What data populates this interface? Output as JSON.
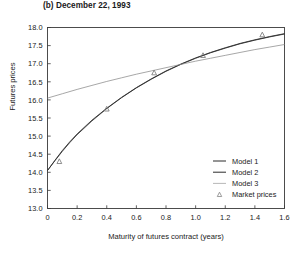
{
  "figure": {
    "panel_label": "(b) December 22, 1993",
    "xlabel": "Maturity of futures contract (years)",
    "ylabel": "Futures prices"
  },
  "chart_data": {
    "type": "line",
    "title": "(b) December 22, 1993",
    "xlabel": "Maturity of futures contract (years)",
    "ylabel": "Futures prices",
    "xlim": [
      0,
      1.6
    ],
    "ylim": [
      13.0,
      18.0
    ],
    "xticks": [
      0,
      0.2,
      0.4,
      0.6,
      0.8,
      1.0,
      1.2,
      1.4,
      1.6
    ],
    "xticklabels": [
      "0",
      "0.2",
      "0.4",
      "0.6",
      "0.8",
      "1.0",
      "1.2",
      "1.4",
      "1.6"
    ],
    "yticks": [
      13.0,
      13.5,
      14.0,
      14.5,
      15.0,
      15.5,
      16.0,
      16.5,
      17.0,
      17.5,
      18.0
    ],
    "yticklabels": [
      "13.0",
      "13.5",
      "14.0",
      "14.5",
      "15.0",
      "15.5",
      "16.0",
      "16.5",
      "17.0",
      "17.5",
      "18.0"
    ],
    "grid": false,
    "legend_position": "lower right",
    "series": [
      {
        "name": "Model 1",
        "style": "solid",
        "color": "#2b2b2b",
        "x": [
          0.0,
          0.05,
          0.1,
          0.15,
          0.2,
          0.3,
          0.4,
          0.5,
          0.6,
          0.7,
          0.8,
          0.9,
          1.0,
          1.1,
          1.2,
          1.3,
          1.4,
          1.5,
          1.6
        ],
        "y": [
          14.05,
          14.32,
          14.58,
          14.82,
          15.04,
          15.42,
          15.76,
          16.06,
          16.33,
          16.57,
          16.79,
          16.98,
          17.15,
          17.3,
          17.43,
          17.55,
          17.65,
          17.74,
          17.82
        ]
      },
      {
        "name": "Model 2",
        "style": "solid",
        "color": "#2b2b2b",
        "x": [
          0.0,
          0.05,
          0.1,
          0.15,
          0.2,
          0.3,
          0.4,
          0.5,
          0.6,
          0.7,
          0.8,
          0.9,
          1.0,
          1.1,
          1.2,
          1.3,
          1.4,
          1.5,
          1.6
        ],
        "y": [
          14.05,
          14.33,
          14.6,
          14.84,
          15.06,
          15.44,
          15.77,
          16.07,
          16.34,
          16.58,
          16.8,
          16.99,
          17.16,
          17.31,
          17.44,
          17.56,
          17.66,
          17.75,
          17.83
        ]
      },
      {
        "name": "Model 3",
        "style": "solid",
        "color": "#8a8a8a",
        "x": [
          0.0,
          0.1,
          0.2,
          0.3,
          0.4,
          0.5,
          0.6,
          0.7,
          0.8,
          0.9,
          1.0,
          1.1,
          1.2,
          1.3,
          1.4,
          1.5,
          1.6
        ],
        "y": [
          16.05,
          16.17,
          16.29,
          16.4,
          16.51,
          16.61,
          16.71,
          16.8,
          16.89,
          16.98,
          17.07,
          17.15,
          17.23,
          17.31,
          17.39,
          17.46,
          17.53
        ]
      },
      {
        "name": "Market prices",
        "style": "marker",
        "marker": "triangle",
        "color": "#7a7a7a",
        "x": [
          0.08,
          0.4,
          0.72,
          1.05,
          1.45
        ],
        "y": [
          14.3,
          15.75,
          16.75,
          17.23,
          17.8
        ]
      }
    ],
    "legend": [
      {
        "label": "Model 1",
        "type": "line",
        "color": "#2b2b2b"
      },
      {
        "label": "Model 2",
        "type": "line",
        "color": "#2b2b2b"
      },
      {
        "label": "Model 3",
        "type": "line",
        "color": "#9a9a9a"
      },
      {
        "label": "Market prices",
        "type": "triangle",
        "color": "#8a8a8a"
      }
    ]
  }
}
